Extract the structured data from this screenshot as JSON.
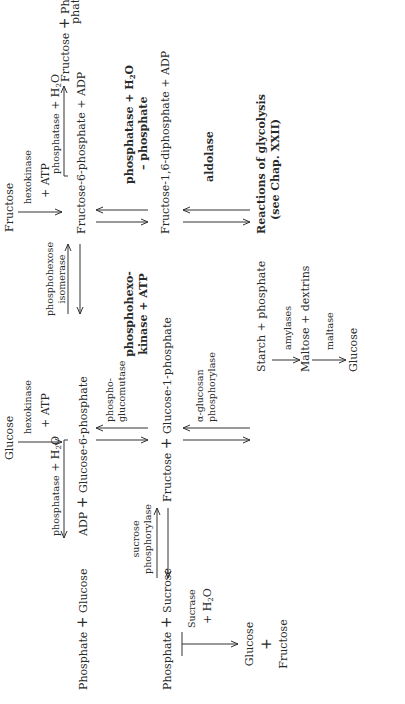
{
  "diagram": {
    "orientation": "rotated-90-ccw",
    "top_sources": {
      "glucose": "Glucose",
      "glucose_enzyme": "hexokinase",
      "glucose_cofactor": "+ ATP",
      "fructose": "Fructose",
      "fructose_enzyme": "hexokinase",
      "fructose_cofactor": "+ ATP"
    },
    "row1": {
      "left_product_a": "Phosphate",
      "plus": "+",
      "left_product_b": "Glucose",
      "left_enzyme": "phosphatase",
      "left_cofactor": "+ H",
      "h2o_sub": "2",
      "h2o_o": "O",
      "adp": "ADP",
      "g6p": "Glucose-6-phosphate",
      "isomerase_1": "phosphohexose",
      "isomerase_2": "isomerase",
      "f6p": "Fructose-6-phosphate",
      "f6p_adp": "+ ADP",
      "right_enzyme": "phosphatase",
      "right_cofactor": "+ H",
      "right_product_a": "Fructose",
      "right_product_b_1": "Phos-",
      "right_product_b_2": "phate"
    },
    "mid_labels": {
      "phosphoglucomutase_1": "phospho-",
      "phosphoglucomutase_2": "glucomutase",
      "phosphohexokinase_1": "phosphohexo-",
      "phosphohexokinase_2": "kinase + ATP",
      "fdp_phosphatase_1": "phosphatase + H",
      "fdp_phosphatase_2": "– phosphate"
    },
    "row2": {
      "phosphate": "Phosphate",
      "sucrose": "Sucrose",
      "sucrose_enzyme_1": "sucrose",
      "sucrose_enzyme_2": "phosphorylase",
      "fructose": "Fructose",
      "g1p": "Glucose-1-phosphate",
      "fdp": "Fructose-1,6-diphosphate",
      "fdp_adp": "+ ADP"
    },
    "lower_labels": {
      "sucrase": "Sucrase",
      "sucrase_cofactor": "+ H",
      "aglucan_1": "α-glucosan",
      "aglucan_2": "phosphorylase",
      "aldolase": "aldolase"
    },
    "row3": {
      "hydrolysis_glucose": "Glucose",
      "hydrolysis_plus": "+",
      "hydrolysis_fructose": "Fructose",
      "starch": "Starch + phosphate",
      "amylases": "amylases",
      "maltose": "Maltose + dextrins",
      "maltase": "maltase",
      "glucose_final": "Glucose",
      "glycolysis_1": "Reactions of glycolysis",
      "glycolysis_2": "(see Chap. XXII)"
    }
  }
}
